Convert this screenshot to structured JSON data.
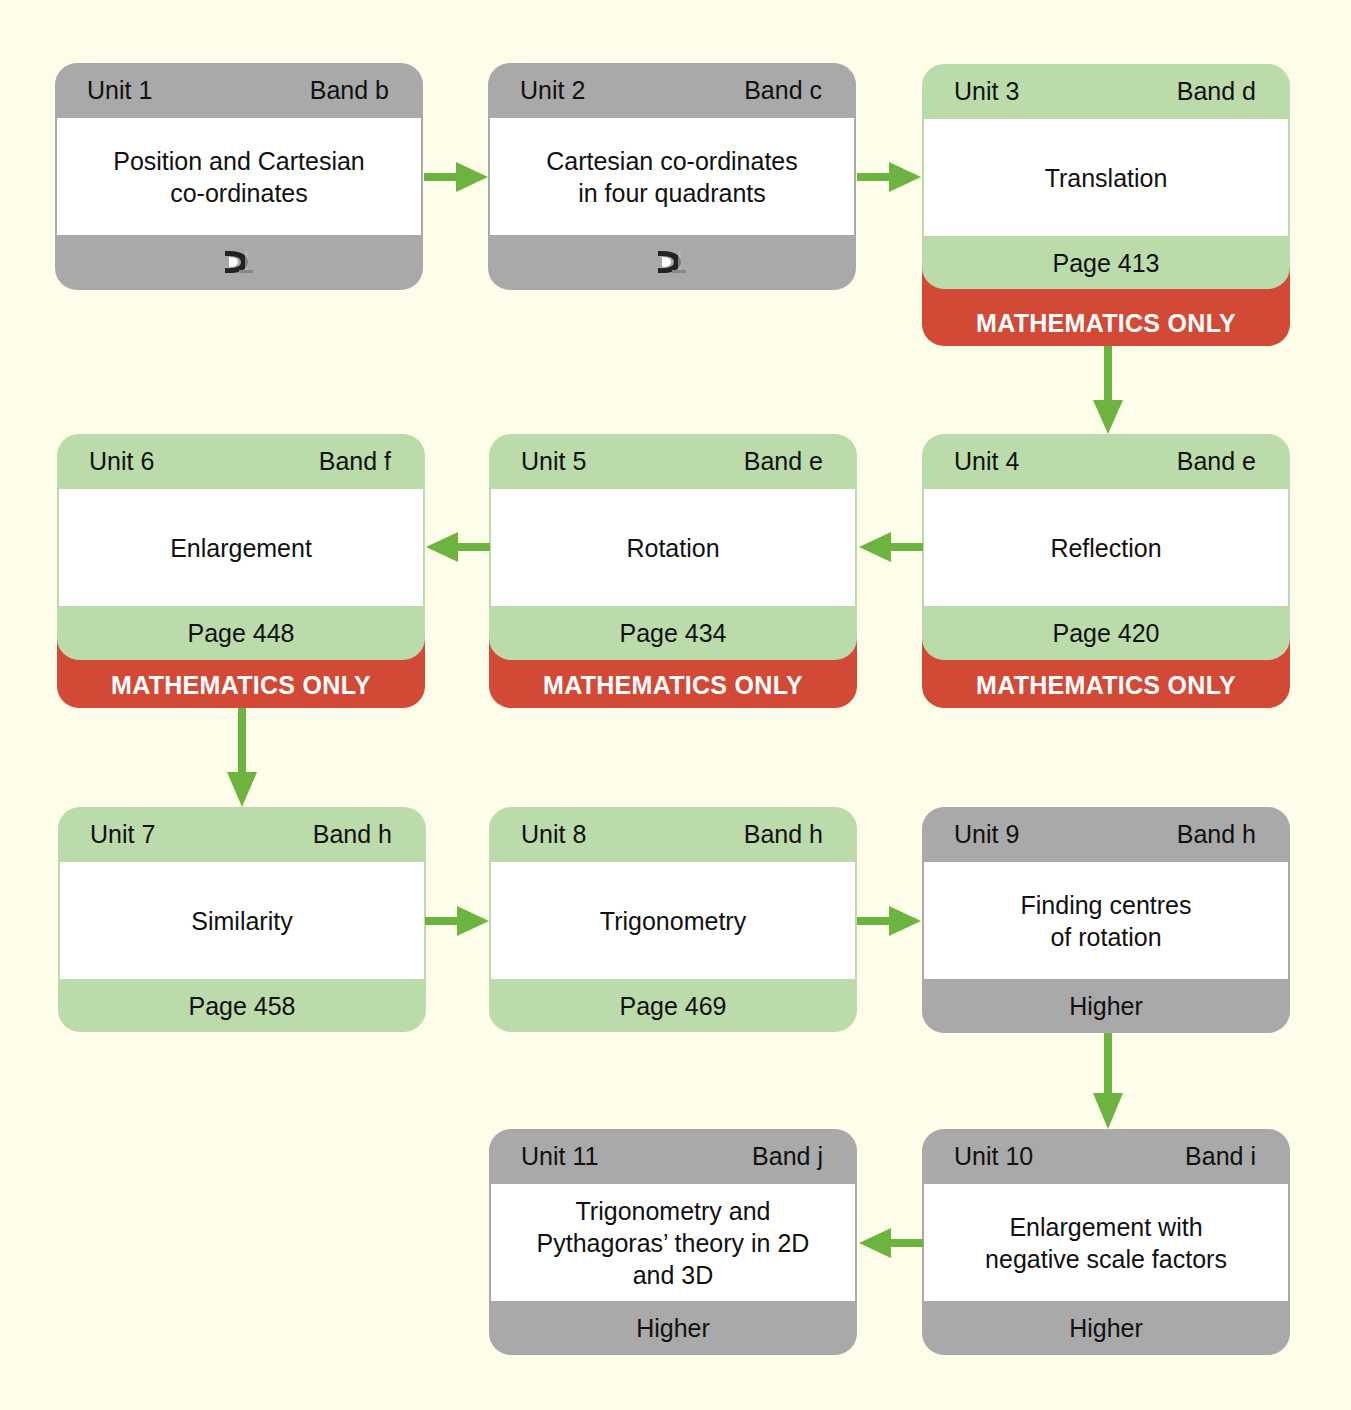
{
  "colors": {
    "background": "#fdfde9",
    "grey_card": "#a9a9a9",
    "green_card": "#bcdbaa",
    "red_strip": "#d24a35",
    "arrow": "#6cb33f"
  },
  "units": [
    {
      "unit": "Unit 1",
      "band": "Band b",
      "title_lines": [
        "Position and Cartesian",
        "co-ordinates"
      ],
      "footer": "",
      "footer_icon": "prior-knowledge-icon",
      "style": "grey",
      "strip": ""
    },
    {
      "unit": "Unit 2",
      "band": "Band c",
      "title_lines": [
        "Cartesian co-ordinates",
        "in four quadrants"
      ],
      "footer": "",
      "footer_icon": "prior-knowledge-icon",
      "style": "grey",
      "strip": ""
    },
    {
      "unit": "Unit 3",
      "band": "Band d",
      "title_lines": [
        "Translation"
      ],
      "footer": "Page 413",
      "style": "green",
      "strip": "MATHEMATICS ONLY"
    },
    {
      "unit": "Unit 4",
      "band": "Band e",
      "title_lines": [
        "Reflection"
      ],
      "footer": "Page 420",
      "style": "green",
      "strip": "MATHEMATICS ONLY"
    },
    {
      "unit": "Unit 5",
      "band": "Band e",
      "title_lines": [
        "Rotation"
      ],
      "footer": "Page 434",
      "style": "green",
      "strip": "MATHEMATICS ONLY"
    },
    {
      "unit": "Unit 6",
      "band": "Band f",
      "title_lines": [
        "Enlargement"
      ],
      "footer": "Page 448",
      "style": "green",
      "strip": "MATHEMATICS ONLY"
    },
    {
      "unit": "Unit 7",
      "band": "Band h",
      "title_lines": [
        "Similarity"
      ],
      "footer": "Page 458",
      "style": "green",
      "strip": ""
    },
    {
      "unit": "Unit 8",
      "band": "Band h",
      "title_lines": [
        "Trigonometry"
      ],
      "footer": "Page 469",
      "style": "green",
      "strip": ""
    },
    {
      "unit": "Unit 9",
      "band": "Band h",
      "title_lines": [
        "Finding centres",
        "of rotation"
      ],
      "footer": "Higher",
      "style": "grey",
      "strip": ""
    },
    {
      "unit": "Unit 10",
      "band": "Band i",
      "title_lines": [
        "Enlargement with",
        "negative scale factors"
      ],
      "footer": "Higher",
      "style": "grey",
      "strip": ""
    },
    {
      "unit": "Unit 11",
      "band": "Band j",
      "title_lines": [
        "Trigonometry and",
        "Pythagoras’ theory in 2D",
        "and 3D"
      ],
      "footer": "Higher",
      "style": "grey",
      "strip": ""
    }
  ],
  "flow": [
    {
      "from": "Unit 1",
      "to": "Unit 2",
      "direction": "right"
    },
    {
      "from": "Unit 2",
      "to": "Unit 3",
      "direction": "right"
    },
    {
      "from": "Unit 3",
      "to": "Unit 4",
      "direction": "down"
    },
    {
      "from": "Unit 4",
      "to": "Unit 5",
      "direction": "left"
    },
    {
      "from": "Unit 5",
      "to": "Unit 6",
      "direction": "left"
    },
    {
      "from": "Unit 6",
      "to": "Unit 7",
      "direction": "down"
    },
    {
      "from": "Unit 7",
      "to": "Unit 8",
      "direction": "right"
    },
    {
      "from": "Unit 8",
      "to": "Unit 9",
      "direction": "right"
    },
    {
      "from": "Unit 9",
      "to": "Unit 10",
      "direction": "down"
    },
    {
      "from": "Unit 10",
      "to": "Unit 11",
      "direction": "left"
    }
  ]
}
